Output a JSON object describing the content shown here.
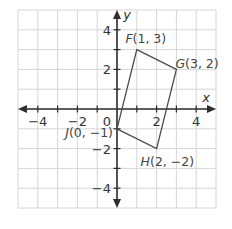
{
  "chart_data": {
    "type": "scatter",
    "title": "",
    "xlabel": "x",
    "ylabel": "y",
    "xlim": [
      -5,
      5
    ],
    "ylim": [
      -5,
      5
    ],
    "grid": true,
    "x_tick_labels": [
      {
        "value": -4,
        "label": "−4"
      },
      {
        "value": -2,
        "label": "−2"
      },
      {
        "value": 2,
        "label": "2"
      },
      {
        "value": 4,
        "label": "4"
      }
    ],
    "y_tick_labels": [
      {
        "value": 4,
        "label": "4"
      },
      {
        "value": 2,
        "label": "2"
      },
      {
        "value": -2,
        "label": "−2"
      },
      {
        "value": -4,
        "label": "−4"
      }
    ],
    "origin_label": "0",
    "polygon": {
      "name": "FGHJ",
      "vertices": [
        {
          "name": "F",
          "x": 1,
          "y": 3,
          "coords": "(1, 3)",
          "label_position": "above"
        },
        {
          "name": "G",
          "x": 3,
          "y": 2,
          "coords": "(3, 2)",
          "label_position": "right"
        },
        {
          "name": "H",
          "x": 2,
          "y": -2,
          "coords": "(2, −2)",
          "label_position": "below"
        },
        {
          "name": "J",
          "x": 0,
          "y": -1,
          "coords": "(0, −1)",
          "label_position": "left"
        }
      ]
    }
  }
}
